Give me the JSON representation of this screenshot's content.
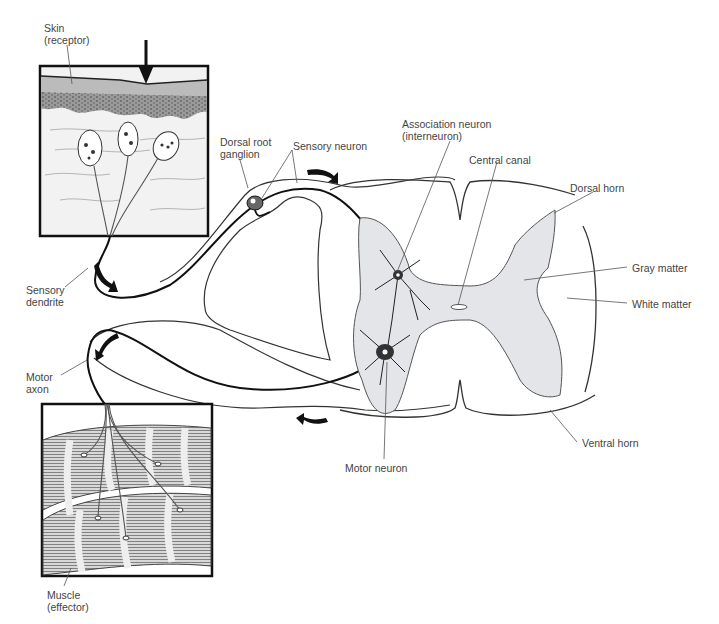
{
  "diagram": {
    "colors": {
      "gray_matter": "#e3e5e8",
      "line": "#1a1a1a",
      "label": "#444444",
      "box_border": "#111111"
    },
    "labels": {
      "skin": "Skin\n(receptor)",
      "dorsal_root_ganglion": "Dorsal root\nganglion",
      "sensory_neuron": "Sensory neuron",
      "association_neuron": "Association neuron\n(interneuron)",
      "central_canal": "Central canal",
      "dorsal_horn": "Dorsal horn",
      "gray_matter": "Gray matter",
      "white_matter": "White matter",
      "sensory_dendrite": "Sensory\ndendrite",
      "motor_axon": "Motor\naxon",
      "motor_neuron": "Motor neuron",
      "ventral_horn": "Ventral horn",
      "muscle": "Muscle\n(effector)"
    }
  }
}
